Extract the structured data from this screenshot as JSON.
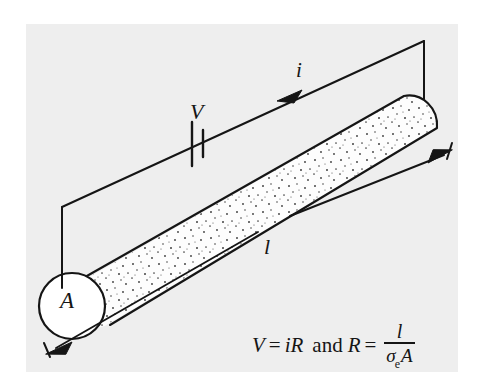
{
  "figure": {
    "type": "physics-diagram",
    "background_color": "#eeeeee",
    "page_color": "#ffffff",
    "stroke_color": "#151515",
    "specimen_fill": "#fdfdfd",
    "labels": {
      "current": "i",
      "voltage": "V",
      "length": "l",
      "area": "A"
    },
    "equation": {
      "left": "V",
      "equals": "=",
      "right": "iR",
      "conjunction": "and",
      "second_left": "R",
      "second_equals": "=",
      "fraction_numerator": "l",
      "fraction_denominator_symbol": "σ",
      "fraction_denominator_subscript": "e",
      "fraction_denominator_area": "A",
      "full_text": "V = iR and R = l / σeA"
    },
    "elements": {
      "battery_symbol": "battery",
      "current_arrow": "arrow-right-up",
      "dimension_arrow_left": "arrow-down-left",
      "dimension_arrow_right": "arrow-up-right",
      "cross_section_circle": "circle-A",
      "specimen": "speckled-cylinder"
    }
  }
}
